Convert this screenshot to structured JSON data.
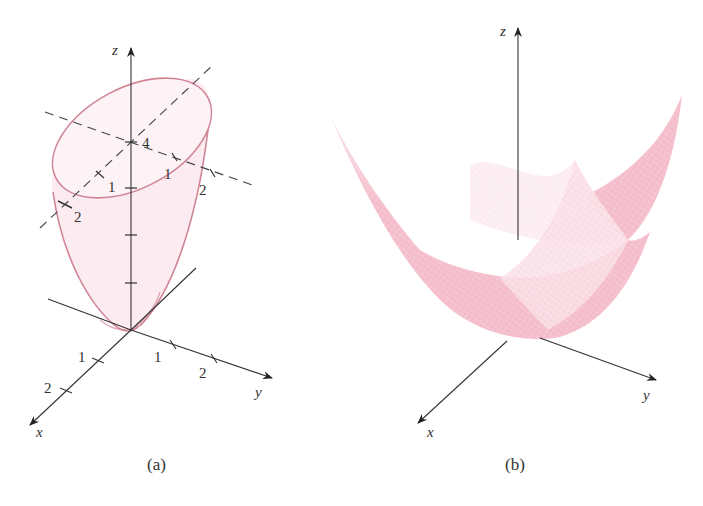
{
  "panel_a": {
    "caption": "(a)",
    "axes": {
      "x": "x",
      "y": "y",
      "z": "z"
    },
    "ticks": {
      "z_top": "4",
      "plane_x_1": "1",
      "plane_x_2": "2",
      "plane_y_1": "1",
      "plane_y_2": "2",
      "x_1": "1",
      "x_2": "2",
      "y_1": "1",
      "y_2": "2"
    }
  },
  "panel_b": {
    "caption": "(b)",
    "axes": {
      "x": "x",
      "y": "y",
      "z": "z"
    }
  },
  "colors": {
    "surface_edge": "#d08090",
    "surface_fill": "#fbe8ee",
    "mesh_fill": "#f4bccb",
    "mesh_dark": "#eea7b9",
    "axis": "#333333"
  }
}
